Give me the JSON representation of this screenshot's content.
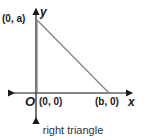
{
  "diagram": {
    "caption": "right triangle",
    "axes": {
      "x_label": "x",
      "y_label": "y",
      "origin_label": "O"
    },
    "points": [
      {
        "name": "apex",
        "label": "(0, a)"
      },
      {
        "name": "origin",
        "label": "(0, 0)"
      },
      {
        "name": "base",
        "label": "(b, 0)"
      }
    ],
    "colors": {
      "axis": "#1a1a1a",
      "triangle": "#808080"
    }
  }
}
